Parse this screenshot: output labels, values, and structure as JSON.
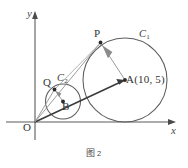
{
  "figure": {
    "caption_text": "图",
    "caption_number": "2",
    "axes": {
      "x_label": "x",
      "y_label": "y",
      "origin_label": "O"
    },
    "points": [
      {
        "name": "O",
        "label": "O",
        "x": 35,
        "y": 122
      },
      {
        "name": "P",
        "label": "P",
        "x": 100.5,
        "y": 42.5
      },
      {
        "name": "Q",
        "label": "Q",
        "x": 54.5,
        "y": 89.5
      },
      {
        "name": "A",
        "label": "A",
        "x": 125,
        "y": 80
      },
      {
        "name": "B",
        "label": "B",
        "x": 63,
        "y": 101.5
      }
    ],
    "circles": [
      {
        "name": "C1",
        "label": "C",
        "subscript": "1",
        "cx": 125,
        "cy": 80,
        "r": 42
      },
      {
        "name": "C2",
        "label": "C",
        "subscript": "2",
        "cx": 63,
        "cy": 101.5,
        "r": 17.5
      }
    ],
    "center_a_coordinates": "A(10, 5)",
    "colors": {
      "stroke": "#555555",
      "axis": "#555555",
      "label": "#333333",
      "background": "#ffffff"
    }
  }
}
